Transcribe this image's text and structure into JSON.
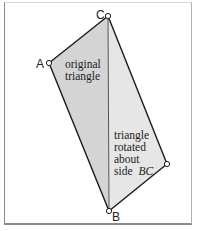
{
  "diagram": {
    "vertices": {
      "A": {
        "label": "A",
        "x": 49,
        "y": 63
      },
      "B": {
        "label": "B",
        "x": 109,
        "y": 211
      },
      "C": {
        "label": "C",
        "x": 108,
        "y": 16
      },
      "A_rotated": {
        "label": "",
        "x": 167,
        "y": 164
      }
    },
    "regions": {
      "original": {
        "label_lines": [
          "original",
          "triangle"
        ],
        "fill": "#d4d4d4"
      },
      "rotated": {
        "label_lines": [
          "triangle",
          "rotated",
          "about",
          "side "
        ],
        "label_italic_suffix": "BC",
        "fill": "#e6e6e6"
      }
    },
    "colors": {
      "stroke": "#1a1a1a",
      "vertex_fill": "#ffffff",
      "frame": "#8a8a8a"
    }
  }
}
